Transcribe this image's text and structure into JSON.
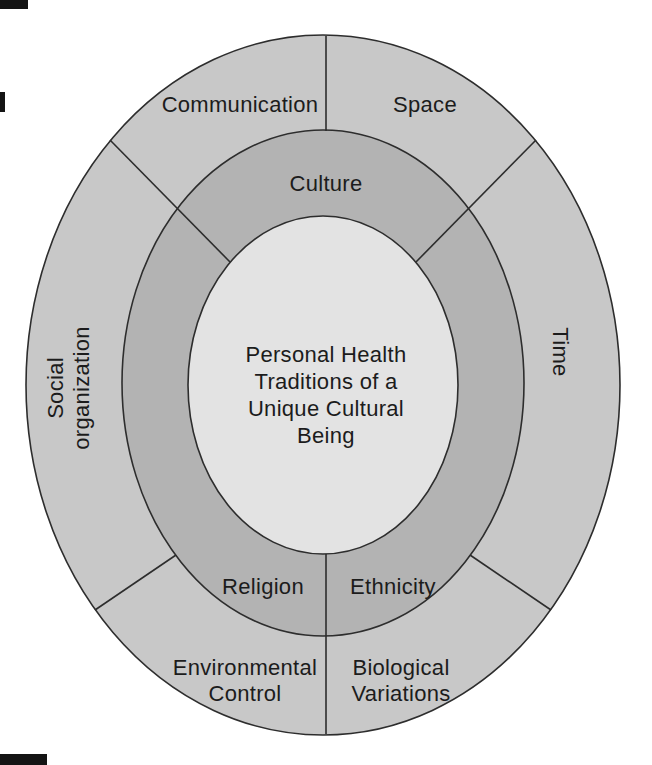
{
  "diagram": {
    "center_label": {
      "lines": [
        "Personal Health",
        "Traditions of a",
        "Unique Cultural",
        "Being"
      ]
    },
    "middle_ring": {
      "top": "Culture",
      "bottom_left": "Religion",
      "bottom_right": "Ethnicity"
    },
    "outer_ring": {
      "top_left": "Communication",
      "top_right": "Space",
      "left_lines": [
        "Social",
        "organization"
      ],
      "right": "Time",
      "bottom_left_lines": [
        "Environmental",
        "Control"
      ],
      "bottom_right_lines": [
        "Biological",
        "Variations"
      ]
    },
    "colors": {
      "background": "#ffffff",
      "outer_ring_fill": "#c8c8c8",
      "middle_ring_fill": "#b3b3b3",
      "inner_fill": "#e3e3e3",
      "line": "#2d2d2d",
      "text": "#1c1c1c"
    }
  }
}
